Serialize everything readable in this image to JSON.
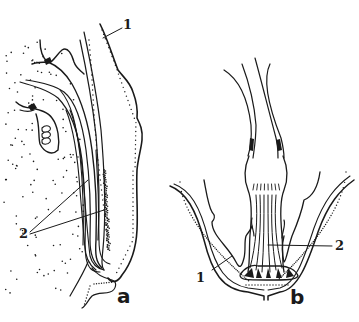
{
  "figure": {
    "panels": [
      {
        "id": "a",
        "label": "a",
        "callouts": [
          {
            "number": "1"
          },
          {
            "number": "2"
          }
        ]
      },
      {
        "id": "b",
        "label": "b",
        "callouts": [
          {
            "number": "1"
          },
          {
            "number": "2"
          }
        ]
      }
    ],
    "colors": {
      "ink": "#1a1a1a",
      "background": "#ffffff"
    }
  }
}
